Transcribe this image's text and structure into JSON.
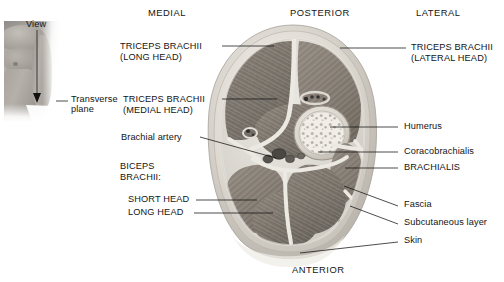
{
  "figure": {
    "background_color": "#ffffff"
  },
  "inset": {
    "name": "orientation-inset",
    "view_label": "View",
    "plane_label_line1": "Transverse",
    "plane_label_line2": "plane",
    "arrow_direction": "down"
  },
  "orientation": {
    "top_left": "MEDIAL",
    "top_center": "POSTERIOR",
    "top_right": "LATERAL",
    "bottom_center": "ANTERIOR"
  },
  "labels_left": [
    {
      "id": "triceps-long-head",
      "line1": "TRICEPS BRACHII",
      "line2": "(LONG HEAD)",
      "style": "caps"
    },
    {
      "id": "triceps-medial-head",
      "line1": "TRICEPS BRACHII",
      "line2": "(MEDIAL HEAD)",
      "style": "caps"
    },
    {
      "id": "brachial-artery",
      "line1": "Brachial artery",
      "line2": "",
      "style": "mixed"
    },
    {
      "id": "biceps-brachii",
      "line1": "BICEPS",
      "line2": "BRACHII:",
      "style": "caps"
    },
    {
      "id": "biceps-short-head",
      "line1": "SHORT HEAD",
      "line2": "",
      "style": "caps"
    },
    {
      "id": "biceps-long-head",
      "line1": "LONG HEAD",
      "line2": "",
      "style": "caps"
    }
  ],
  "labels_right": [
    {
      "id": "triceps-lateral-head",
      "line1": "TRICEPS BRACHII",
      "line2": "(LATERAL HEAD)",
      "style": "caps"
    },
    {
      "id": "humerus",
      "line1": "Humerus",
      "line2": "",
      "style": "mixed"
    },
    {
      "id": "coracobrachialis",
      "line1": "Coracobrachialis",
      "line2": "",
      "style": "mixed"
    },
    {
      "id": "brachialis",
      "line1": "BRACHIALIS",
      "line2": "",
      "style": "caps"
    },
    {
      "id": "fascia",
      "line1": "Fascia",
      "line2": "",
      "style": "mixed"
    },
    {
      "id": "subcutaneous-layer",
      "line1": "Subcutaneous layer",
      "line2": "",
      "style": "mixed"
    },
    {
      "id": "skin",
      "line1": "Skin",
      "line2": "",
      "style": "mixed"
    }
  ],
  "cross_section": {
    "name": "arm-transverse-section",
    "structures": [
      "triceps brachii long head",
      "triceps brachii medial head",
      "triceps brachii lateral head",
      "humerus",
      "brachial artery",
      "coracobrachialis",
      "brachialis",
      "biceps brachii short head",
      "biceps brachii long head",
      "fascia",
      "subcutaneous layer",
      "skin"
    ],
    "colors": {
      "muscle": "#8a8279",
      "muscle_dark": "#6f6860",
      "septum": "#e6e3dc",
      "bone_cortex": "#cfcac1",
      "bone_marrow": "#efece4",
      "skin_rim": "#cdc9c2",
      "subcutaneous": "#dbd7d0",
      "vessel": "#3a3734"
    }
  }
}
